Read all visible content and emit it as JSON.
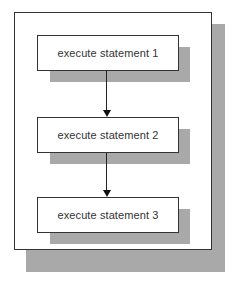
{
  "diagram": {
    "type": "flowchart",
    "direction": "top-to-bottom",
    "colors": {
      "border": "#333333",
      "shadow": "#a9a9a9",
      "fill": "#ffffff",
      "arrow": "#222222"
    },
    "nodes": [
      {
        "id": "s1",
        "label": "execute statement 1"
      },
      {
        "id": "s2",
        "label": "execute statement 2"
      },
      {
        "id": "s3",
        "label": "execute statement 3"
      }
    ],
    "edges": [
      {
        "from": "s1",
        "to": "s2"
      },
      {
        "from": "s2",
        "to": "s3"
      }
    ]
  }
}
